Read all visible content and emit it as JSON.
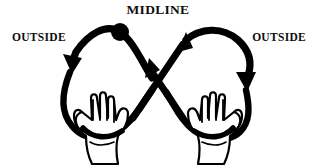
{
  "diagram": {
    "kind": "lazy-eight-midline-exercise",
    "background_color": "#ffffff",
    "ink_color": "#000000",
    "labels": {
      "midline": "MIDLINE",
      "outside_left": "OUTSIDE",
      "outside_right": "OUTSIDE"
    },
    "markers": {
      "midline_dot": {
        "shape": "filled-circle",
        "color": "#000000",
        "center_x": 120,
        "center_y": 32,
        "radius": 9
      }
    },
    "arrows": [
      {
        "name": "left-loop-descending",
        "direction": "down-left",
        "at_x": 72,
        "at_y": 62
      },
      {
        "name": "center-left-ascending",
        "direction": "up-left",
        "at_x": 150,
        "at_y": 57
      },
      {
        "name": "center-right-ascending",
        "direction": "up-right",
        "at_x": 183,
        "at_y": 40
      },
      {
        "name": "right-loop-descending",
        "direction": "down-right",
        "at_x": 246,
        "at_y": 78
      }
    ],
    "hands": [
      {
        "name": "left-hand",
        "orientation": "palm-forward-fingers-up",
        "thumb_side": "left",
        "center_x": 100,
        "center_y": 124
      },
      {
        "name": "right-hand",
        "orientation": "palm-forward-fingers-up",
        "thumb_side": "right",
        "center_x": 217,
        "center_y": 124
      }
    ],
    "stroke": {
      "loop_width": 7,
      "hand_outline_width": 2.2
    }
  }
}
